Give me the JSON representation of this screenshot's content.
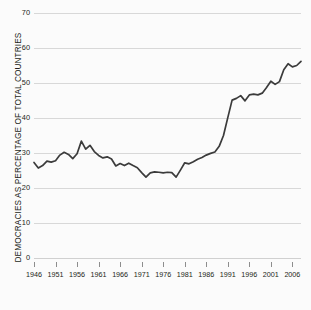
{
  "chart_data": {
    "type": "line",
    "title": "",
    "xlabel": "",
    "ylabel": "DEMOCRACIES AS PERCENTAGE OF TOTAL COUNTRIES",
    "xlim": [
      1946,
      2008
    ],
    "ylim": [
      0,
      70
    ],
    "grid": true,
    "legend": "none",
    "xtick_labels": [
      "1946",
      "1951",
      "1956",
      "1961",
      "1966",
      "1971",
      "1976",
      "1981",
      "1986",
      "1991",
      "1996",
      "2001",
      "2006"
    ],
    "xtick_values": [
      1946,
      1951,
      1956,
      1961,
      1966,
      1971,
      1976,
      1981,
      1986,
      1991,
      1996,
      2001,
      2006
    ],
    "ytick_labels": [
      "0",
      "10",
      "20",
      "30",
      "40",
      "50",
      "60",
      "70"
    ],
    "ytick_values": [
      0,
      10,
      20,
      30,
      40,
      50,
      60,
      70
    ],
    "line_color": "#3b3b3b",
    "grid_color": "#d8d8d8",
    "background_color": "#fbfbfb",
    "series": [
      {
        "name": "Democracies as percentage of total countries",
        "x": [
          1946,
          1947,
          1948,
          1949,
          1950,
          1951,
          1952,
          1953,
          1954,
          1955,
          1956,
          1957,
          1958,
          1959,
          1960,
          1961,
          1962,
          1963,
          1964,
          1965,
          1966,
          1967,
          1968,
          1969,
          1970,
          1971,
          1972,
          1973,
          1974,
          1975,
          1976,
          1977,
          1978,
          1979,
          1980,
          1981,
          1982,
          1983,
          1984,
          1985,
          1986,
          1987,
          1988,
          1989,
          1990,
          1991,
          1992,
          1993,
          1994,
          1995,
          1996,
          1997,
          1998,
          1999,
          2000,
          2001,
          2002,
          2003,
          2004,
          2005,
          2006,
          2007,
          2008
        ],
        "y": [
          27.3,
          25.7,
          26.4,
          27.7,
          27.4,
          27.8,
          29.4,
          30.2,
          29.6,
          28.4,
          29.8,
          33.4,
          31.1,
          32.2,
          30.4,
          29.3,
          28.6,
          28.9,
          28.3,
          26.3,
          27.0,
          26.4,
          27.1,
          26.4,
          25.8,
          24.4,
          23.1,
          24.3,
          24.6,
          24.5,
          24.3,
          24.5,
          24.4,
          23.1,
          25.1,
          27.2,
          26.9,
          27.5,
          28.2,
          28.7,
          29.4,
          29.9,
          30.3,
          31.9,
          35.0,
          40.1,
          45.1,
          45.6,
          46.4,
          44.9,
          46.6,
          46.8,
          46.6,
          47.1,
          48.7,
          50.5,
          49.6,
          50.4,
          53.8,
          55.5,
          54.6,
          55.0,
          56.2
        ]
      }
    ]
  }
}
